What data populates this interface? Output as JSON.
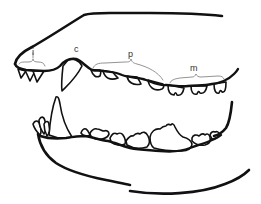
{
  "diagram": {
    "labels": {
      "incisors": "i",
      "canine": "c",
      "premolars": "p",
      "molars": "m"
    },
    "colors": {
      "line": "#111111",
      "brace": "#777777",
      "label": "#333333",
      "background": "#ffffff"
    }
  }
}
